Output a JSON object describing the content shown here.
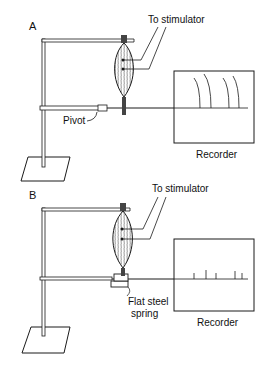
{
  "figure": {
    "panels": [
      {
        "id": "A",
        "label": "A",
        "stimulator_label": "To stimulator",
        "pivot_label": "Pivot",
        "recorder_label": "Recorder",
        "trace": "curved arcs (isotonic contractions)"
      },
      {
        "id": "B",
        "label": "B",
        "stimulator_label": "To stimulator",
        "spring_label_line1": "Flat steel",
        "spring_label_line2": "spring",
        "recorder_label": "Recorder",
        "trace": "short vertical ticks (isometric contractions)"
      }
    ],
    "colors": {
      "ink": "#1a1a1a",
      "background": "#ffffff"
    }
  }
}
